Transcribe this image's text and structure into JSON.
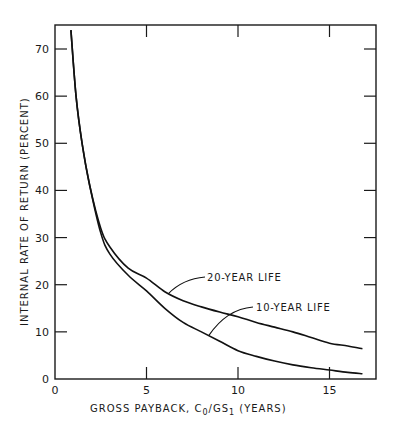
{
  "chart_data": {
    "type": "line",
    "title": "",
    "xlabel": "GROSS PAYBACK, C",
    "xlabel_sub0": "0",
    "xlabel_mid": "/GS",
    "xlabel_sub1": "1",
    "xlabel_end": " (YEARS)",
    "ylabel": "INTERNAL RATE OF RETURN (PERCENT)",
    "xlim": [
      0,
      17.5
    ],
    "ylim": [
      0,
      75
    ],
    "x_ticks": [
      0,
      5,
      10,
      15
    ],
    "x_tick_labels": [
      "0",
      "5",
      "10",
      "15"
    ],
    "y_ticks": [
      0,
      10,
      20,
      30,
      40,
      50,
      60,
      70
    ],
    "y_tick_labels": [
      "0",
      "10",
      "20",
      "30",
      "40",
      "50",
      "60",
      "70"
    ],
    "grid": false,
    "series": [
      {
        "name": "20-YEAR LIFE",
        "x": [
          0.87,
          1.15,
          1.48,
          1.9,
          2.5,
          3.0,
          4.0,
          5.0,
          6.0,
          7.0,
          8.0,
          9.0,
          10.0,
          11.0,
          12.0,
          13.0,
          14.0,
          15.0,
          16.0,
          16.8
        ],
        "y": [
          74,
          60,
          50,
          41,
          32,
          28,
          23.5,
          21.4,
          18.5,
          16.6,
          15.3,
          14.2,
          13.2,
          12.0,
          11.0,
          10.0,
          8.8,
          7.6,
          7.0,
          6.4
        ]
      },
      {
        "name": "10-YEAR LIFE",
        "x": [
          0.87,
          1.15,
          1.48,
          1.9,
          2.5,
          3.0,
          4.0,
          5.0,
          6.0,
          7.0,
          8.0,
          9.0,
          10.0,
          11.0,
          12.0,
          13.0,
          14.0,
          15.0,
          16.0,
          16.8
        ],
        "y": [
          74,
          60,
          50,
          41,
          31,
          26.5,
          22,
          18.7,
          15.0,
          12.0,
          10.0,
          8.0,
          6.0,
          4.8,
          3.8,
          3.0,
          2.4,
          1.9,
          1.4,
          1.1
        ]
      }
    ],
    "annotations": [
      {
        "text": "20-YEAR LIFE",
        "points_to_series": "20-YEAR LIFE",
        "at_x": 6.2
      },
      {
        "text": "10-YEAR LIFE",
        "points_to_series": "10-YEAR LIFE",
        "at_x": 8.4
      }
    ]
  }
}
